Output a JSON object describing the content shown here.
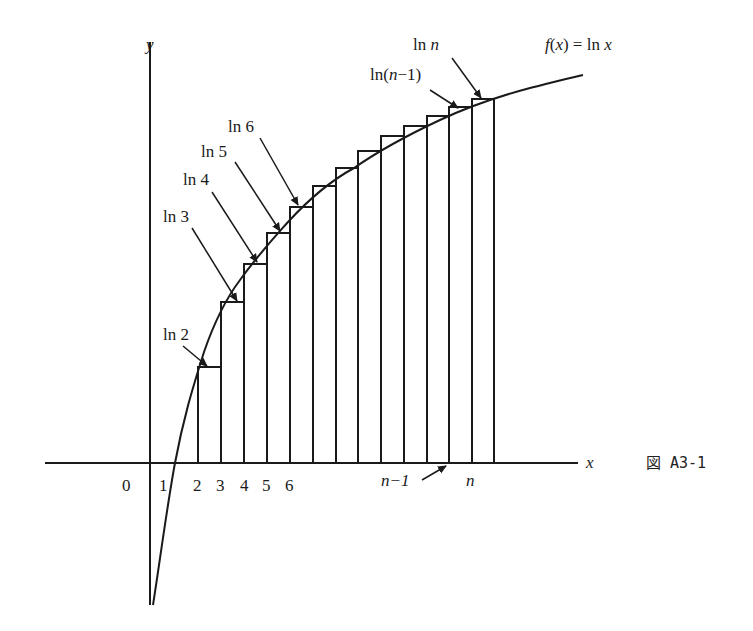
{
  "figure": {
    "caption": "図 A3-1",
    "function_label": "f(x) = ln x",
    "axes": {
      "x_label": "x",
      "y_label": "y",
      "origin_label": "0"
    },
    "x_ticks": [
      "1",
      "2",
      "3",
      "4",
      "5",
      "6",
      "n−1",
      "n"
    ],
    "value_labels": [
      "ln 2",
      "ln 3",
      "ln 4",
      "ln 5",
      "ln 6",
      "ln(n−1)",
      "ln n"
    ],
    "bars": {
      "count": 13,
      "description": "Rectangles of width 1 on [k, k+1] with height ln(k+1)... approximating area under ln x from 1 to n",
      "colors": {
        "stroke": "#1a1a1a",
        "fill": "#ffffff"
      }
    }
  }
}
